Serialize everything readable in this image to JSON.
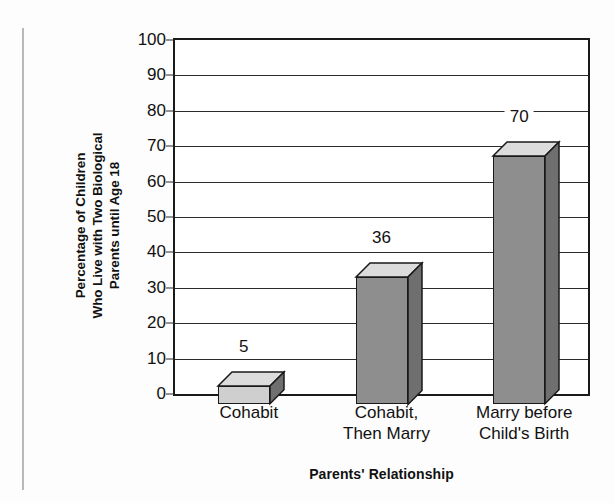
{
  "chart_data": {
    "type": "bar",
    "title": "",
    "categories": [
      "Cohabit",
      "Cohabit,\nThen Marry",
      "Marry before\nChild's Birth"
    ],
    "values": [
      5,
      36,
      70
    ],
    "value_labels": [
      "5",
      "36",
      "70"
    ],
    "xlabel": "Parents' Relationship",
    "ylabel": "Percentage of Children Who Live with Two Biological Parents until Age 18",
    "ylabel_lines": [
      "Percentage of Children",
      "Who Live with Two Biological",
      "Parents until Age 18"
    ],
    "ylim": [
      0,
      100
    ],
    "ytick_step": 10,
    "yticks": [
      0,
      10,
      20,
      30,
      40,
      50,
      60,
      70,
      80,
      90,
      100
    ],
    "ytick_labels": [
      "0",
      "10",
      "20",
      "30",
      "40",
      "50",
      "60",
      "70",
      "80",
      "90",
      "100"
    ],
    "grid": true,
    "grid_axis": "y",
    "legend": null,
    "legend_position": "none",
    "style": "3d-bar",
    "colors": {
      "bar_front_short": "#cfcfcf",
      "bar_front_tall": "#8e8e8e",
      "bar_top": "#dcdcdc",
      "bar_side": "#6f6f6f",
      "outline": "#1a1a1a",
      "gridline": "#2b2b2b",
      "text": "#111111",
      "background": "#fdfdfd",
      "plot_background": "#ffffff",
      "margin_rule": "#b9b9b9"
    }
  }
}
